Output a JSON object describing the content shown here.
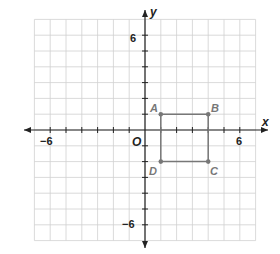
{
  "diagram": {
    "type": "coordinate-plane",
    "x_axis_label": "x",
    "y_axis_label": "y",
    "origin_label": "O",
    "tick_labels": {
      "x_neg": "−6",
      "x_pos": "6",
      "y_pos": "6",
      "y_neg": "−6"
    },
    "range": {
      "xmin": -7,
      "xmax": 7,
      "ymin": -7,
      "ymax": 7
    },
    "colors": {
      "grid": "#d0d0d0",
      "axis": "#222222",
      "shape": "#777777"
    },
    "points": [
      {
        "label": "A",
        "x": 1,
        "y": 1
      },
      {
        "label": "B",
        "x": 4,
        "y": 1
      },
      {
        "label": "C",
        "x": 4,
        "y": -2
      },
      {
        "label": "D",
        "x": 1,
        "y": -2
      }
    ],
    "shape": "rectangle ABCD"
  }
}
